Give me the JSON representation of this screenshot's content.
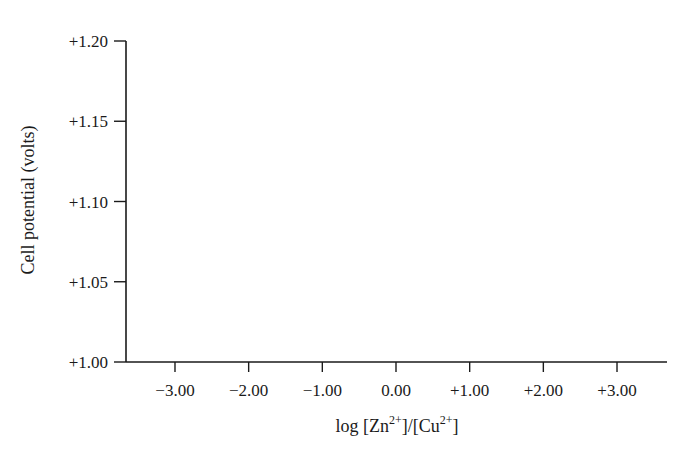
{
  "chart_data": {
    "type": "line",
    "title": "",
    "xlabel": "log [Zn2+]/[Cu2+]",
    "xlabel_parts": {
      "prefix": "log [Zn",
      "sup1": "2+",
      "middle": "]/[Cu",
      "sup2": "2+",
      "suffix": "]"
    },
    "ylabel": "Cell potential (volts)",
    "x_ticks": [
      -3.0,
      -2.0,
      -1.0,
      0.0,
      1.0,
      2.0,
      3.0
    ],
    "x_tick_labels": [
      "−3.00",
      "−2.00",
      "−1.00",
      "0.00",
      "+1.00",
      "+2.00",
      "+3.00"
    ],
    "y_ticks": [
      1.0,
      1.05,
      1.1,
      1.15,
      1.2
    ],
    "y_tick_labels": [
      "+1.00",
      "+1.05",
      "+1.10",
      "+1.15",
      "+1.20"
    ],
    "xlim": [
      -3.67,
      3.67
    ],
    "ylim": [
      1.0,
      1.2
    ],
    "grid": false,
    "legend": null,
    "series": []
  },
  "colors": {
    "axis": "#1a1a1a",
    "background": "#ffffff"
  }
}
